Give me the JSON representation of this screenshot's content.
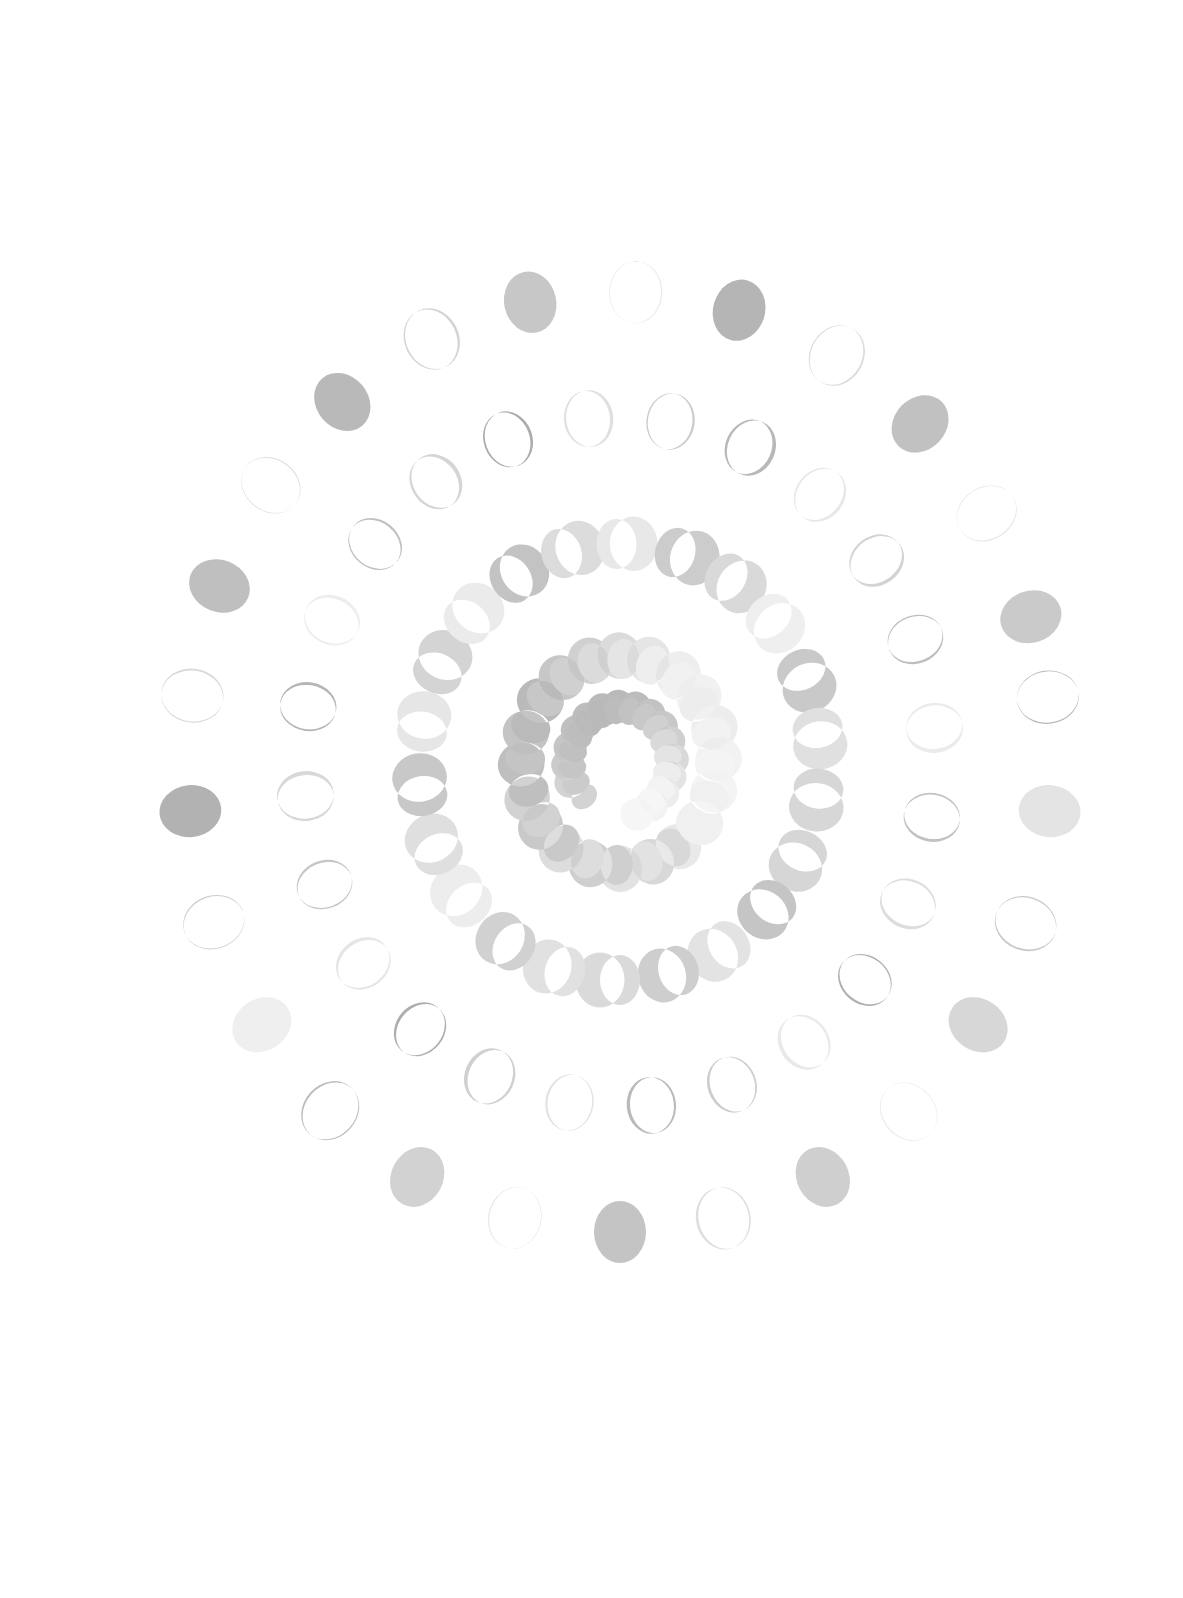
{
  "artwork": {
    "title": "Spiral Moon Phases",
    "background_color": "#ffffff",
    "canvas": {
      "width": 1183,
      "height": 1598
    },
    "center": {
      "x": 620,
      "y": 762
    },
    "description": "Abstract generative composition: concentric spiral rings of moon-phase shapes, full ellipses at the outer edge fading into thin crescents at the centre."
  },
  "chart_data": {
    "type": "scatter",
    "xlabel": "",
    "ylabel": "",
    "xlim": [
      0,
      1183
    ],
    "ylim": [
      0,
      1598
    ],
    "grid": false,
    "legend": null,
    "palette": {
      "dark_gray": "#9a9a9a",
      "mid_gray": "#bcbcbc",
      "light_gray": "#dcdcdc",
      "pale_gray": "#f0f0f0",
      "background": "#ffffff"
    },
    "marker_shape": "moon-phase-ellipse",
    "rings": [
      {
        "name": "ring-1-outer",
        "radius_x": 432,
        "radius_y": 470,
        "count": 26,
        "marker_rx": 26,
        "marker_ry": 31,
        "phase": 0.0,
        "rotation_deg": -8,
        "points": [
          {
            "angle": 0,
            "gray": "#b7b7b7",
            "phase": 0.02
          },
          {
            "angle": 14,
            "gray": "#e4e4e4",
            "phase": 0.0
          },
          {
            "angle": 28,
            "gray": "#c9c9c9",
            "phase": 0.03
          },
          {
            "angle": 42,
            "gray": "#d7d7d7",
            "phase": 0.0
          },
          {
            "angle": 56,
            "gray": "#ececec",
            "phase": 0.02
          },
          {
            "angle": 70,
            "gray": "#cfcfcf",
            "phase": 0.0
          },
          {
            "angle": 84,
            "gray": "#dedede",
            "phase": 0.04
          },
          {
            "angle": 98,
            "gray": "#c4c4c4",
            "phase": 0.0
          },
          {
            "angle": 112,
            "gray": "#e8e8e8",
            "phase": 0.02
          },
          {
            "angle": 126,
            "gray": "#d2d2d2",
            "phase": 0.0
          },
          {
            "angle": 140,
            "gray": "#bdbdbd",
            "phase": 0.03
          },
          {
            "angle": 154,
            "gray": "#efefef",
            "phase": 0.0
          },
          {
            "angle": 168,
            "gray": "#cccccc",
            "phase": 0.02
          },
          {
            "angle": 182,
            "gray": "#b2b2b2",
            "phase": 0.0
          },
          {
            "angle": 196,
            "gray": "#d9d9d9",
            "phase": 0.03
          },
          {
            "angle": 210,
            "gray": "#bfbfbf",
            "phase": 0.0
          },
          {
            "angle": 224,
            "gray": "#e1e1e1",
            "phase": 0.02
          },
          {
            "angle": 238,
            "gray": "#b9b9b9",
            "phase": 0.0
          },
          {
            "angle": 252,
            "gray": "#d4d4d4",
            "phase": 0.04
          },
          {
            "angle": 266,
            "gray": "#c7c7c7",
            "phase": 0.0
          },
          {
            "angle": 280,
            "gray": "#eaeaea",
            "phase": 0.02
          },
          {
            "angle": 294,
            "gray": "#b5b5b5",
            "phase": 0.0
          },
          {
            "angle": 308,
            "gray": "#dbdbdb",
            "phase": 0.03
          },
          {
            "angle": 322,
            "gray": "#c1c1c1",
            "phase": 0.0
          },
          {
            "angle": 336,
            "gray": "#e6e6e6",
            "phase": 0.02
          },
          {
            "angle": 350,
            "gray": "#cacaca",
            "phase": 0.0
          }
        ]
      },
      {
        "name": "ring-2",
        "radius_x": 316,
        "radius_y": 345,
        "count": 24,
        "marker_rx": 23,
        "marker_ry": 28,
        "phase": 0.05,
        "rotation_deg": 4,
        "points": [
          {
            "angle": 5,
            "gray": "#c2c2c2",
            "phase": 0.05
          },
          {
            "angle": 20,
            "gray": "#dddddd",
            "phase": 0.06
          },
          {
            "angle": 35,
            "gray": "#b0b0b0",
            "phase": 0.04
          },
          {
            "angle": 50,
            "gray": "#e9e9e9",
            "phase": 0.07
          },
          {
            "angle": 65,
            "gray": "#cdcdcd",
            "phase": 0.05
          },
          {
            "angle": 80,
            "gray": "#bababa",
            "phase": 0.06
          },
          {
            "angle": 95,
            "gray": "#e2e2e2",
            "phase": 0.04
          },
          {
            "angle": 110,
            "gray": "#d0d0d0",
            "phase": 0.07
          },
          {
            "angle": 125,
            "gray": "#aeaeae",
            "phase": 0.05
          },
          {
            "angle": 140,
            "gray": "#e5e5e5",
            "phase": 0.06
          },
          {
            "angle": 155,
            "gray": "#c6c6c6",
            "phase": 0.04
          },
          {
            "angle": 170,
            "gray": "#d8d8d8",
            "phase": 0.07
          },
          {
            "angle": 185,
            "gray": "#b4b4b4",
            "phase": 0.05
          },
          {
            "angle": 200,
            "gray": "#eeeeee",
            "phase": 0.06
          },
          {
            "angle": 215,
            "gray": "#c0c0c0",
            "phase": 0.04
          },
          {
            "angle": 230,
            "gray": "#d5d5d5",
            "phase": 0.07
          },
          {
            "angle": 245,
            "gray": "#acacac",
            "phase": 0.05
          },
          {
            "angle": 260,
            "gray": "#e0e0e0",
            "phase": 0.06
          },
          {
            "angle": 275,
            "gray": "#cbcbcb",
            "phase": 0.04
          },
          {
            "angle": 290,
            "gray": "#b8b8b8",
            "phase": 0.07
          },
          {
            "angle": 305,
            "gray": "#e7e7e7",
            "phase": 0.05
          },
          {
            "angle": 320,
            "gray": "#d3d3d3",
            "phase": 0.06
          },
          {
            "angle": 335,
            "gray": "#bebebe",
            "phase": 0.04
          },
          {
            "angle": 350,
            "gray": "#ebebeb",
            "phase": 0.07
          }
        ]
      },
      {
        "name": "ring-3",
        "radius_x": 200,
        "radius_y": 218,
        "count": 22,
        "marker_rx": 20,
        "marker_ry": 25,
        "phase": 0.42,
        "rotation_deg": 16,
        "points": [
          {
            "angle": 8,
            "gray": "#d6d6d6",
            "phase": 0.45
          },
          {
            "angle": 24,
            "gray": "#c5c5c5",
            "phase": 0.4
          },
          {
            "angle": 41,
            "gray": "#e3e3e3",
            "phase": 0.48
          },
          {
            "angle": 57,
            "gray": "#cececE",
            "phase": 0.43
          },
          {
            "angle": 74,
            "gray": "#dadada",
            "phase": 0.5
          },
          {
            "angle": 90,
            "gray": "#e1e1e1",
            "phase": 0.46
          },
          {
            "angle": 106,
            "gray": "#d1d1d1",
            "phase": 0.41
          },
          {
            "angle": 123,
            "gray": "#ededed",
            "phase": 0.49
          },
          {
            "angle": 139,
            "gray": "#dfdfdf",
            "phase": 0.44
          },
          {
            "angle": 155,
            "gray": "#c8c8c8",
            "phase": 0.47
          },
          {
            "angle": 172,
            "gray": "#e6e6e6",
            "phase": 0.42
          },
          {
            "angle": 188,
            "gray": "#d4d4d4",
            "phase": 0.5
          },
          {
            "angle": 204,
            "gray": "#ebebeb",
            "phase": 0.45
          },
          {
            "angle": 221,
            "gray": "#c3c3c3",
            "phase": 0.4
          },
          {
            "angle": 237,
            "gray": "#dcdcdc",
            "phase": 0.48
          },
          {
            "angle": 253,
            "gray": "#e8e8e8",
            "phase": 0.43
          },
          {
            "angle": 270,
            "gray": "#cccccc",
            "phase": 0.51
          },
          {
            "angle": 286,
            "gray": "#d9d9d9",
            "phase": 0.46
          },
          {
            "angle": 302,
            "gray": "#efefef",
            "phase": 0.41
          },
          {
            "angle": 319,
            "gray": "#c9c9c9",
            "phase": 0.49
          },
          {
            "angle": 335,
            "gray": "#e0e0e0",
            "phase": 0.44
          },
          {
            "angle": 351,
            "gray": "#d7d7d7",
            "phase": 0.47
          }
        ]
      },
      {
        "name": "ring-4-inner",
        "radius_x": 95,
        "radius_y": 103,
        "count": 20,
        "marker_rx": 16,
        "marker_ry": 20,
        "phase": 0.82,
        "rotation_deg": 26,
        "points": [
          {
            "angle": 12,
            "gray": "#e9e9e9",
            "phase": 0.84
          },
          {
            "angle": 30,
            "gray": "#d8d8d8",
            "phase": 0.8
          },
          {
            "angle": 48,
            "gray": "#e2e2e2",
            "phase": 0.86
          },
          {
            "angle": 66,
            "gray": "#cfcfcf",
            "phase": 0.82
          },
          {
            "angle": 84,
            "gray": "#dddddd",
            "phase": 0.88
          },
          {
            "angle": 102,
            "gray": "#c9c9c9",
            "phase": 0.83
          },
          {
            "angle": 120,
            "gray": "#d2d2d2",
            "phase": 0.79
          },
          {
            "angle": 138,
            "gray": "#bfbfbf",
            "phase": 0.85
          },
          {
            "angle": 156,
            "gray": "#c4c4c4",
            "phase": 0.81
          },
          {
            "angle": 174,
            "gray": "#bababa",
            "phase": 0.87
          },
          {
            "angle": 192,
            "gray": "#c7c7c7",
            "phase": 0.83
          },
          {
            "angle": 210,
            "gray": "#d0d0d0",
            "phase": 0.89
          },
          {
            "angle": 228,
            "gray": "#dbdbdb",
            "phase": 0.84
          },
          {
            "angle": 246,
            "gray": "#e5e5e5",
            "phase": 0.8
          },
          {
            "angle": 264,
            "gray": "#eeeeee",
            "phase": 0.86
          },
          {
            "angle": 282,
            "gray": "#f1f1f1",
            "phase": 0.82
          },
          {
            "angle": 300,
            "gray": "#ededed",
            "phase": 0.88
          },
          {
            "angle": 318,
            "gray": "#f2f2f2",
            "phase": 0.83
          },
          {
            "angle": 336,
            "gray": "#f4f4f4",
            "phase": 0.79
          },
          {
            "angle": 354,
            "gray": "#f0f0f0",
            "phase": 0.85
          }
        ]
      },
      {
        "name": "ring-5-core",
        "radius_x": 48,
        "radius_y": 52,
        "count": 16,
        "marker_rx": 11,
        "marker_ry": 14,
        "phase": 0.93,
        "rotation_deg": 38,
        "points": [
          {
            "angle": 100,
            "gray": "#d3d3d3",
            "phase": 0.93
          },
          {
            "angle": 118,
            "gray": "#cbcbcb",
            "phase": 0.94
          },
          {
            "angle": 136,
            "gray": "#c5c5c5",
            "phase": 0.92
          },
          {
            "angle": 154,
            "gray": "#c0c0c0",
            "phase": 0.95
          },
          {
            "angle": 172,
            "gray": "#bdbdbd",
            "phase": 0.93
          },
          {
            "angle": 190,
            "gray": "#bababa",
            "phase": 0.94
          },
          {
            "angle": 208,
            "gray": "#b9b9b9",
            "phase": 0.92
          },
          {
            "angle": 226,
            "gray": "#bcbcbc",
            "phase": 0.95
          },
          {
            "angle": 244,
            "gray": "#c2c2c2",
            "phase": 0.93
          },
          {
            "angle": 262,
            "gray": "#c8c8c8",
            "phase": 0.94
          },
          {
            "angle": 280,
            "gray": "#d0d0d0",
            "phase": 0.92
          },
          {
            "angle": 298,
            "gray": "#d9d9d9",
            "phase": 0.95
          },
          {
            "angle": 316,
            "gray": "#e4e4e4",
            "phase": 0.93
          },
          {
            "angle": 334,
            "gray": "#ededed",
            "phase": 0.94
          },
          {
            "angle": 352,
            "gray": "#f3f3f3",
            "phase": 0.92
          },
          {
            "angle": 10,
            "gray": "#f6f6f6",
            "phase": 0.95
          }
        ]
      }
    ]
  }
}
